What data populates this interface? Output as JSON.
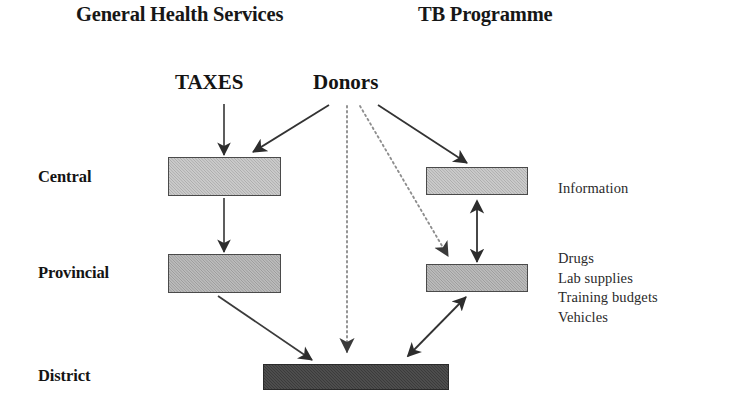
{
  "diagram": {
    "headers": [
      {
        "id": "general-health-services",
        "label": "General Health Services"
      },
      {
        "id": "tb-programme",
        "label": "TB Programme"
      }
    ],
    "sources": [
      {
        "id": "taxes",
        "label": "TAXES"
      },
      {
        "id": "donors",
        "label": "Donors"
      }
    ],
    "levels": [
      {
        "id": "central",
        "label": "Central"
      },
      {
        "id": "provincial",
        "label": "Provincial"
      },
      {
        "id": "district",
        "label": "District"
      }
    ],
    "annotations": {
      "information": "Information",
      "resources": [
        "Drugs",
        "Lab supplies",
        "Training budgets",
        "Vehicles"
      ]
    },
    "nodes": [
      {
        "id": "ghs-central",
        "column": "general-health-services",
        "level": "central",
        "fill": "light"
      },
      {
        "id": "ghs-provincial",
        "column": "general-health-services",
        "level": "provincial",
        "fill": "mid"
      },
      {
        "id": "tb-central",
        "column": "tb-programme",
        "level": "central",
        "fill": "light"
      },
      {
        "id": "tb-provincial",
        "column": "tb-programme",
        "level": "provincial",
        "fill": "mid"
      },
      {
        "id": "district-shared",
        "column": "shared",
        "level": "district",
        "fill": "dark"
      }
    ],
    "edges": [
      {
        "id": "taxes-to-ghs-central",
        "from": "taxes",
        "to": "ghs-central",
        "style": "solid",
        "heads": "single"
      },
      {
        "id": "ghs-central-to-provincial",
        "from": "ghs-central",
        "to": "ghs-provincial",
        "style": "solid",
        "heads": "single"
      },
      {
        "id": "ghs-provincial-to-district",
        "from": "ghs-provincial",
        "to": "district-shared",
        "style": "solid",
        "heads": "single"
      },
      {
        "id": "donors-to-ghs-central",
        "from": "donors",
        "to": "ghs-central",
        "style": "solid",
        "heads": "single"
      },
      {
        "id": "donors-to-tb-central",
        "from": "donors",
        "to": "tb-central",
        "style": "solid",
        "heads": "single"
      },
      {
        "id": "donors-to-tb-provincial",
        "from": "donors",
        "to": "tb-provincial",
        "style": "dotted",
        "heads": "single"
      },
      {
        "id": "donors-to-district",
        "from": "donors",
        "to": "district-shared",
        "style": "dotted",
        "heads": "single"
      },
      {
        "id": "tb-central-provincial",
        "from": "tb-central",
        "to": "tb-provincial",
        "style": "solid",
        "heads": "double"
      },
      {
        "id": "tb-provincial-district",
        "from": "tb-provincial",
        "to": "district-shared",
        "style": "solid",
        "heads": "double"
      }
    ],
    "colors": {
      "ink": "#1a1a1a",
      "box_light": "#b6b6b6",
      "box_mid": "#a8a8a8",
      "box_dark": "#3b3b3b",
      "box_border": "#4a4a4a",
      "background": "#ffffff"
    }
  }
}
